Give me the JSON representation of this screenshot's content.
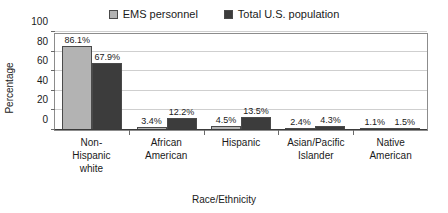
{
  "chart_data": {
    "type": "bar",
    "title": "",
    "subtitle": "",
    "xlabel": "Race/Ethnicity",
    "ylabel": "Percentage",
    "ylim": [
      0,
      100
    ],
    "yticks": [
      0,
      20,
      40,
      60,
      80,
      100
    ],
    "ytick_labels": [
      "0",
      "20",
      "40",
      "60",
      "80",
      "100"
    ],
    "grid": true,
    "legend_position": "top-center",
    "categories": [
      "Non-Hispanic white",
      "African American",
      "Hispanic",
      "Asian/Pacific Islander",
      "Native American"
    ],
    "category_lines": [
      [
        "Non-",
        "Hispanic",
        "white"
      ],
      [
        "African",
        "American"
      ],
      [
        "Hispanic"
      ],
      [
        "Asian/Pacific",
        "Islander"
      ],
      [
        "Native",
        "American"
      ]
    ],
    "series": [
      {
        "name": "EMS personnel",
        "color": "#b3b3b3",
        "values": [
          86.1,
          3.4,
          4.5,
          2.4,
          1.1
        ],
        "labels": [
          "86.1%",
          "3.4%",
          "4.5%",
          "2.4%",
          "1.1%"
        ]
      },
      {
        "name": "Total U.S. population",
        "color": "#3c3c3c",
        "values": [
          67.9,
          12.2,
          13.5,
          4.3,
          1.5
        ],
        "labels": [
          "67.9%",
          "12.2%",
          "13.5%",
          "4.3%",
          "1.5%"
        ]
      }
    ]
  }
}
